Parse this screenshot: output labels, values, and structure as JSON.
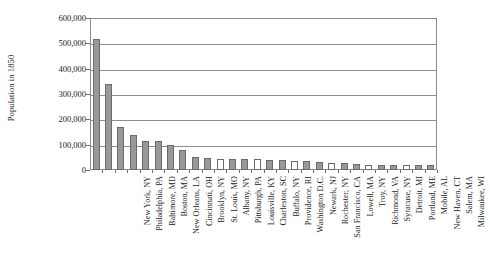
{
  "chart_data": {
    "type": "bar",
    "title": "",
    "xlabel": "",
    "ylabel": "Population in 1850",
    "ylim": [
      0,
      600000
    ],
    "ytick_values": [
      0,
      100000,
      200000,
      300000,
      400000,
      500000,
      600000
    ],
    "ytick_labels": [
      "0",
      "100,000",
      "200,000",
      "300,000",
      "400,000",
      "500,000",
      "600,000"
    ],
    "grid": true,
    "legend": "none",
    "bar_color": "#999999",
    "bar_edge_color": "#6b6b6b",
    "axis_color": "#8a8a8a",
    "categories": [
      "New York, NY",
      "Philadelphia, PA",
      "Baltimore, MD",
      "Boston, MA",
      "New Orleans, LA",
      "Cincinnati, OH",
      "Brooklyn, NY",
      "St. Louis, MO",
      "Albany, NY",
      "Pittsburgh, PA",
      "Louisville, KY",
      "Charleston, SC",
      "Buffalo, NY",
      "Providence, RI",
      "Washington D.C.",
      "Newark, NJ",
      "Rochester, NY",
      "San Francisco, CA",
      "Lowell, MA",
      "Troy, NY",
      "Richmond, VA",
      "Syracuse, NY",
      "Detroit, MI",
      "Portland, ME",
      "Mobile, AL",
      "New Haven, CT",
      "Salem, MA",
      "Milwaukee, WI"
    ],
    "values": [
      515547,
      340045,
      169054,
      136881,
      116375,
      115435,
      96838,
      77860,
      50763,
      46601,
      43194,
      42985,
      42261,
      41513,
      40001,
      38894,
      36403,
      34776,
      33383,
      28785,
      27570,
      22271,
      21019,
      20815,
      20515,
      20345,
      20264,
      20061
    ]
  }
}
